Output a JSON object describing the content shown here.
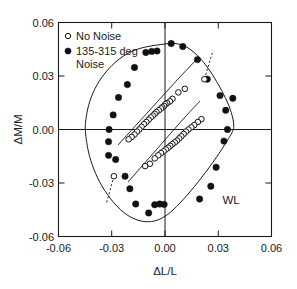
{
  "chart_data": {
    "type": "scatter",
    "title": "",
    "xlabel": "ΔL/L",
    "ylabel": "ΔM/M",
    "xlim": [
      -0.06,
      0.06
    ],
    "ylim": [
      -0.06,
      0.06
    ],
    "xticks": [
      "-0.06",
      "-0.03",
      "0.00",
      "0.03",
      "0.06"
    ],
    "xtick_values": [
      -0.06,
      -0.03,
      0.0,
      0.03,
      0.06
    ],
    "yticks": [
      "-0.06",
      "-0.03",
      "0.00",
      "0.03",
      "0.06"
    ],
    "ytick_values": [
      -0.06,
      -0.03,
      0.0,
      0.03,
      0.06
    ],
    "grid": false,
    "zero_lines": true,
    "legend_position": "top-left",
    "annotations": [
      {
        "text": "WL",
        "x": 0.037,
        "y": -0.042
      }
    ],
    "legend": [
      {
        "label": "No Noise",
        "marker": "open-circle"
      },
      {
        "label": "135-315 deg Noise",
        "marker": "filled-circle"
      }
    ],
    "series": [
      {
        "name": "135-315 deg Noise",
        "marker": "filled-circle",
        "color": "#111111",
        "points": [
          [
            0.0035,
            0.0482
          ],
          [
            0.01,
            0.0465
          ],
          [
            -0.0045,
            0.044
          ],
          [
            -0.0075,
            0.0438
          ],
          [
            -0.0108,
            0.0432
          ],
          [
            0.0183,
            0.0392
          ],
          [
            -0.0172,
            0.0348
          ],
          [
            0.0238,
            0.0282
          ],
          [
            -0.0212,
            0.0252
          ],
          [
            -0.0262,
            0.018
          ],
          [
            0.031,
            0.019
          ],
          [
            0.0382,
            0.0175
          ],
          [
            0.0342,
            0.0108
          ],
          [
            -0.0292,
            0.0082
          ],
          [
            -0.0315,
            0.0
          ],
          [
            0.0352,
            0.0
          ],
          [
            -0.0318,
            -0.0068
          ],
          [
            0.0332,
            -0.0065
          ],
          [
            -0.0278,
            -0.0168
          ],
          [
            -0.0318,
            -0.0145
          ],
          [
            0.0288,
            -0.0212
          ],
          [
            -0.0225,
            -0.0262
          ],
          [
            0.0258,
            -0.0318
          ],
          [
            -0.0198,
            -0.0332
          ],
          [
            0.0195,
            -0.039
          ],
          [
            -0.0165,
            -0.0418
          ],
          [
            -0.0058,
            -0.0422
          ],
          [
            -0.003,
            -0.0418
          ],
          [
            -0.0005,
            -0.042
          ],
          [
            -0.0092,
            -0.0468
          ]
        ]
      },
      {
        "name": "No Noise (upper branch)",
        "marker": "open-circle",
        "color": "#111111",
        "points": [
          [
            0.0222,
            0.0282
          ],
          [
            0.0112,
            0.0228
          ],
          [
            0.0075,
            0.0208
          ],
          [
            0.0042,
            0.0172
          ],
          [
            0.0028,
            0.0158
          ],
          [
            0.0012,
            0.0148
          ],
          [
            0.0002,
            0.0142
          ],
          [
            -0.0005,
            0.0132
          ],
          [
            -0.0015,
            0.0125
          ],
          [
            -0.0022,
            0.0118
          ],
          [
            -0.0035,
            0.0108
          ],
          [
            -0.0048,
            0.0098
          ],
          [
            -0.0058,
            0.0088
          ],
          [
            -0.0068,
            0.0078
          ],
          [
            -0.008,
            0.0068
          ],
          [
            -0.0092,
            0.0055
          ],
          [
            -0.0105,
            0.0042
          ],
          [
            -0.0118,
            0.003
          ],
          [
            -0.0132,
            0.0015
          ],
          [
            -0.0145,
            0.0
          ],
          [
            -0.0158,
            -0.0012
          ],
          [
            -0.0172,
            -0.0028
          ],
          [
            -0.0188,
            -0.0042
          ],
          [
            -0.0205,
            -0.0055
          ],
          [
            -0.0288,
            -0.0262
          ]
        ]
      },
      {
        "name": "No Noise (lower branch)",
        "marker": "open-circle",
        "color": "#111111",
        "points": [
          [
            0.0205,
            0.0058
          ],
          [
            0.0185,
            0.0042
          ],
          [
            0.0165,
            0.0025
          ],
          [
            0.0148,
            0.0012
          ],
          [
            0.0132,
            0.0
          ],
          [
            0.0118,
            -0.0012
          ],
          [
            0.0105,
            -0.0025
          ],
          [
            0.0092,
            -0.0038
          ],
          [
            0.008,
            -0.005
          ],
          [
            0.0068,
            -0.0062
          ],
          [
            0.0055,
            -0.0072
          ],
          [
            0.0042,
            -0.0082
          ],
          [
            0.003,
            -0.0092
          ],
          [
            0.0018,
            -0.0102
          ],
          [
            0.0005,
            -0.0112
          ],
          [
            -0.0008,
            -0.0122
          ],
          [
            -0.0022,
            -0.0132
          ],
          [
            -0.0038,
            -0.0145
          ],
          [
            -0.0058,
            -0.0162
          ],
          [
            -0.0085,
            -0.0192
          ],
          [
            -0.0112,
            -0.0205
          ]
        ]
      }
    ]
  },
  "legend": {
    "no_noise_label": "No Noise",
    "noise_label_line1": "135-315 deg",
    "noise_label_line2": "Noise"
  },
  "axes": {
    "x_title": "ΔL/L",
    "y_title": "ΔM/M",
    "x_tick_labels": [
      "-0.06",
      "-0.03",
      "0.00",
      "0.03",
      "0.06"
    ],
    "y_tick_labels": [
      "-0.06",
      "-0.03",
      "0.00",
      "0.03",
      "0.06"
    ]
  },
  "annotation": {
    "wl": "WL"
  },
  "colors": {
    "axis": "#1a1a1a",
    "marker_filled": "#111111",
    "marker_open_fill": "#ffffff",
    "background": "#ffffff"
  }
}
